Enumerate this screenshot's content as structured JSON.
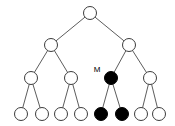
{
  "figure": {
    "width": 175,
    "height": 126,
    "background_color": "#ffffff",
    "edge_color": "#4a4a4a",
    "node_outline_color": "#3c3c3c",
    "node_open_fill": "#ffffff",
    "node_filled_fill": "#000000",
    "node_radius": 6.5
  },
  "chart_data": {
    "type": "diagram",
    "subtype": "binary-tree",
    "title": "",
    "legend": [],
    "annotations": [
      {
        "id": "label-M",
        "text": "M",
        "x": 97,
        "y": 70,
        "target_node": "n2-1"
      }
    ],
    "levels": [
      {
        "depth": 0,
        "y": 13,
        "count": 1
      },
      {
        "depth": 1,
        "y": 45,
        "count": 2
      },
      {
        "depth": 2,
        "y": 78,
        "count": 4
      },
      {
        "depth": 3,
        "y": 114,
        "count": 8
      }
    ],
    "nodes": [
      {
        "id": "root",
        "x": 90,
        "y": 13,
        "depth": 0,
        "fill": "open",
        "label": ""
      },
      {
        "id": "n1-0",
        "x": 51,
        "y": 45,
        "depth": 1,
        "fill": "open",
        "label": ""
      },
      {
        "id": "n1-1",
        "x": 129,
        "y": 45,
        "depth": 1,
        "fill": "open",
        "label": ""
      },
      {
        "id": "n2-0",
        "x": 31,
        "y": 78,
        "depth": 2,
        "fill": "open",
        "label": ""
      },
      {
        "id": "n2-0b",
        "x": 71,
        "y": 78,
        "depth": 2,
        "fill": "open",
        "label": ""
      },
      {
        "id": "n2-1",
        "x": 111,
        "y": 78,
        "depth": 2,
        "fill": "filled",
        "label": "M"
      },
      {
        "id": "n2-1b",
        "x": 150,
        "y": 78,
        "depth": 2,
        "fill": "open",
        "label": ""
      },
      {
        "id": "n3-0",
        "x": 21,
        "y": 114,
        "depth": 3,
        "fill": "open",
        "label": ""
      },
      {
        "id": "n3-1",
        "x": 42,
        "y": 114,
        "depth": 3,
        "fill": "open",
        "label": ""
      },
      {
        "id": "n3-2",
        "x": 61,
        "y": 114,
        "depth": 3,
        "fill": "open",
        "label": ""
      },
      {
        "id": "n3-3",
        "x": 81,
        "y": 114,
        "depth": 3,
        "fill": "open",
        "label": ""
      },
      {
        "id": "n3-4",
        "x": 101,
        "y": 114,
        "depth": 3,
        "fill": "filled",
        "label": ""
      },
      {
        "id": "n3-5",
        "x": 122,
        "y": 114,
        "depth": 3,
        "fill": "filled",
        "label": ""
      },
      {
        "id": "n3-6",
        "x": 141,
        "y": 114,
        "depth": 3,
        "fill": "open",
        "label": ""
      },
      {
        "id": "n3-7",
        "x": 159,
        "y": 114,
        "depth": 3,
        "fill": "open",
        "label": ""
      }
    ],
    "edges": [
      {
        "from": "root",
        "to": "n1-0"
      },
      {
        "from": "root",
        "to": "n1-1"
      },
      {
        "from": "n1-0",
        "to": "n2-0"
      },
      {
        "from": "n1-0",
        "to": "n2-0b"
      },
      {
        "from": "n1-1",
        "to": "n2-1"
      },
      {
        "from": "n1-1",
        "to": "n2-1b"
      },
      {
        "from": "n2-0",
        "to": "n3-0"
      },
      {
        "from": "n2-0",
        "to": "n3-1"
      },
      {
        "from": "n2-0b",
        "to": "n3-2"
      },
      {
        "from": "n2-0b",
        "to": "n3-3"
      },
      {
        "from": "n2-1",
        "to": "n3-4"
      },
      {
        "from": "n2-1",
        "to": "n3-5"
      },
      {
        "from": "n2-1b",
        "to": "n3-6"
      },
      {
        "from": "n2-1b",
        "to": "n3-7"
      }
    ]
  }
}
